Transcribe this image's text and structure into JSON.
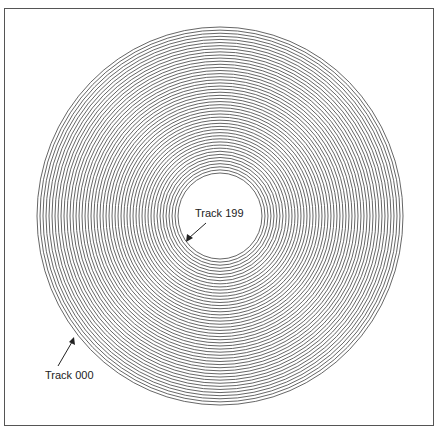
{
  "diagram": {
    "type": "disk-tracks",
    "labels": {
      "inner_track": "Track 199",
      "outer_track": "Track 000"
    },
    "rings": {
      "count": 48,
      "center_x": 220,
      "center_y": 216,
      "inner_rx": 42,
      "inner_ry": 43,
      "outer_rx": 183,
      "outer_ry": 189,
      "stroke": "#555555"
    },
    "frame_color": "#555555"
  }
}
